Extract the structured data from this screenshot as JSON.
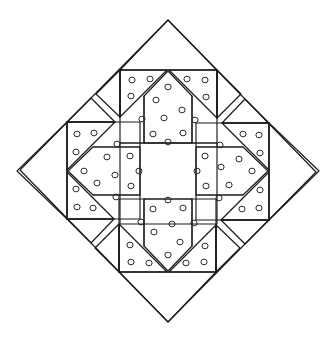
{
  "figure": {
    "type": "geometric-line-diagram",
    "canvas": {
      "width": 335,
      "height": 337,
      "background": "#ffffff"
    },
    "stroke_color": "#1a1a1a",
    "dot_stroke_color": "#2b2b2b",
    "dot_fill": "none",
    "dot_radius": 3.1
  },
  "outer_diamond": {
    "name": "outer-diamond",
    "center": {
      "x": 168,
      "y": 171
    },
    "vertices": [
      {
        "x": 168,
        "y": 20
      },
      {
        "x": 316,
        "y": 172
      },
      {
        "x": 168,
        "y": 322
      },
      {
        "x": 20,
        "y": 170
      }
    ]
  },
  "center_square": {
    "name": "center-square",
    "dotted": false,
    "points": [
      {
        "x": 120,
        "y": 143
      },
      {
        "x": 217,
        "y": 143
      },
      {
        "x": 217,
        "y": 224
      },
      {
        "x": 120,
        "y": 224
      }
    ]
  },
  "motifs": [
    {
      "id": "top",
      "label": "Top house motif",
      "rotation_deg": 0,
      "dot_count": 21
    },
    {
      "id": "right",
      "label": "Right house motif",
      "rotation_deg": 90,
      "dot_count": 21
    },
    {
      "id": "bottom",
      "label": "Bottom house motif",
      "rotation_deg": 180,
      "dot_count": 21
    },
    {
      "id": "left",
      "label": "Left house motif",
      "rotation_deg": 270,
      "dot_count": 21
    }
  ],
  "motif_geometry": {
    "comment": "Coordinates given for the TOP motif in page space; other motifs are 90/180/270 degree rotations about the center (168,171).",
    "band_top_y": 70,
    "band_bottom_y": 143,
    "band_left_x": 120,
    "band_right_x": 217,
    "pentagon": {
      "name": "center-pentagon",
      "points": [
        {
          "x": 144,
          "y": 96
        },
        {
          "x": 168,
          "y": 71
        },
        {
          "x": 192,
          "y": 96
        },
        {
          "x": 192,
          "y": 143
        },
        {
          "x": 144,
          "y": 143
        }
      ]
    },
    "left_triangle": {
      "name": "left-dotted-triangle",
      "points": [
        {
          "x": 120,
          "y": 70
        },
        {
          "x": 167,
          "y": 70
        },
        {
          "x": 120,
          "y": 117
        }
      ]
    },
    "right_triangle": {
      "name": "right-dotted-triangle",
      "points": [
        {
          "x": 169,
          "y": 70
        },
        {
          "x": 217,
          "y": 70
        },
        {
          "x": 217,
          "y": 118
        }
      ]
    },
    "outer_left_triangle": {
      "name": "outer-left-plain-triangle",
      "points": [
        {
          "x": 120,
          "y": 70
        },
        {
          "x": 120,
          "y": 117
        },
        {
          "x": 96,
          "y": 94
        }
      ]
    },
    "outer_right_triangle": {
      "name": "outer-right-plain-triangle",
      "points": [
        {
          "x": 217,
          "y": 70
        },
        {
          "x": 217,
          "y": 118
        },
        {
          "x": 241,
          "y": 94
        }
      ]
    },
    "apex_triangle": {
      "name": "apex-plain-triangle",
      "points": [
        {
          "x": 120,
          "y": 70
        },
        {
          "x": 217,
          "y": 70
        },
        {
          "x": 168,
          "y": 20
        }
      ]
    },
    "vertical_guides": [
      {
        "x": 120,
        "y1": 70,
        "y2": 117
      },
      {
        "x": 144,
        "y1": 96,
        "y2": 143
      },
      {
        "x": 192,
        "y1": 96,
        "y2": 143
      },
      {
        "x": 217,
        "y1": 70,
        "y2": 118
      }
    ],
    "dots": [
      {
        "x": 132,
        "y": 80
      },
      {
        "x": 150,
        "y": 79
      },
      {
        "x": 131,
        "y": 96
      },
      {
        "x": 168,
        "y": 87
      },
      {
        "x": 187,
        "y": 79
      },
      {
        "x": 205,
        "y": 80
      },
      {
        "x": 206,
        "y": 97
      },
      {
        "x": 156,
        "y": 100
      },
      {
        "x": 182,
        "y": 110
      },
      {
        "x": 164,
        "y": 118
      },
      {
        "x": 153,
        "y": 134
      },
      {
        "x": 183,
        "y": 133
      },
      {
        "x": 168,
        "y": 142
      },
      {
        "x": 142,
        "y": 119
      },
      {
        "x": 195,
        "y": 120
      }
    ]
  },
  "legend": {
    "shown": false
  }
}
